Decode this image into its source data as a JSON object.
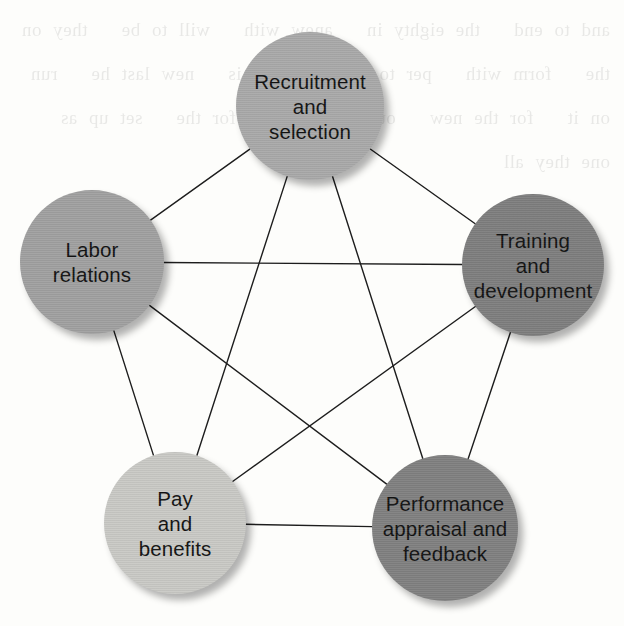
{
  "diagram": {
    "type": "pentagon-network",
    "background_color": "#fdfdfb",
    "edge_color": "#1d1d1d",
    "edge_width": 1.4,
    "bleed_text": "and to end   the eighty in   anew with   will to be   they on the   form with   per to a   use why is   new last he   run on it   for the new   out where   and for the   set up as   one they all",
    "nodes": [
      {
        "id": "recruitment",
        "name": "recruitment-and-selection",
        "label": "Recruitment and selection",
        "lines": [
          "Recruitment",
          "and",
          "selection"
        ],
        "cx": 310,
        "cy": 106,
        "r": 74,
        "color": "#a9a9a9"
      },
      {
        "id": "training",
        "name": "training-and-development",
        "label": "Training and development",
        "lines": [
          "Training",
          "and",
          "development"
        ],
        "cx": 533,
        "cy": 265,
        "r": 71,
        "color": "#7e7e7e"
      },
      {
        "id": "performance",
        "name": "performance-appraisal-and-feedback",
        "label": "Performance appraisal and feedback",
        "lines": [
          "Performance",
          "appraisal and",
          "feedback"
        ],
        "cx": 445,
        "cy": 528,
        "r": 73,
        "color": "#808080"
      },
      {
        "id": "pay",
        "name": "pay-and-benefits",
        "label": "Pay and benefits",
        "lines": [
          "Pay",
          "and",
          "benefits"
        ],
        "cx": 175,
        "cy": 523,
        "r": 71,
        "color": "#c9c9c5"
      },
      {
        "id": "labor",
        "name": "labor-relations",
        "label": "Labor relations",
        "lines": [
          "Labor",
          "relations"
        ],
        "cx": 92,
        "cy": 262,
        "r": 72,
        "color": "#a0a0a0"
      }
    ],
    "edges": [
      {
        "from": "recruitment",
        "to": "training",
        "kind": "perimeter"
      },
      {
        "from": "training",
        "to": "performance",
        "kind": "perimeter"
      },
      {
        "from": "performance",
        "to": "pay",
        "kind": "perimeter"
      },
      {
        "from": "pay",
        "to": "labor",
        "kind": "perimeter"
      },
      {
        "from": "labor",
        "to": "recruitment",
        "kind": "perimeter"
      },
      {
        "from": "recruitment",
        "to": "performance",
        "kind": "diagonal"
      },
      {
        "from": "recruitment",
        "to": "pay",
        "kind": "diagonal"
      },
      {
        "from": "training",
        "to": "pay",
        "kind": "diagonal"
      },
      {
        "from": "training",
        "to": "labor",
        "kind": "diagonal"
      },
      {
        "from": "performance",
        "to": "labor",
        "kind": "diagonal"
      }
    ]
  }
}
